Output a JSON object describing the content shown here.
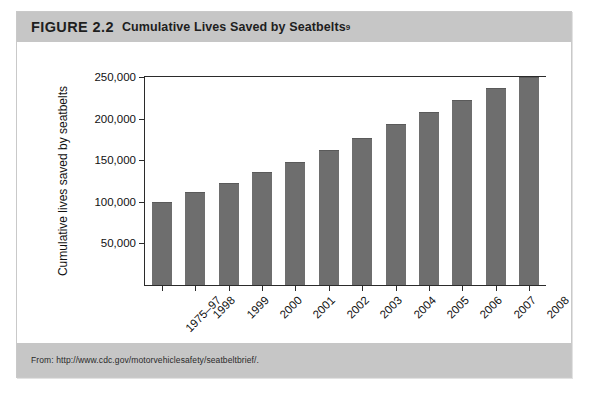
{
  "figure": {
    "label": "FIGURE 2.2",
    "title": "Cumulative Lives Saved by Seatbelts",
    "title_superscript": "9",
    "source": "From: http://www.cdc.gov/motorvehiclesafety/seatbeltbrief/.",
    "header_color": "#c6c6c6",
    "footer_color": "#c6c6c6",
    "bar_color": "#6e6e6e",
    "axis_color": "#2b2b2b",
    "page_background": "#ffffff"
  },
  "chart_data": {
    "type": "bar",
    "title": "Cumulative Lives Saved by Seatbelts",
    "xlabel": "",
    "ylabel": "Cumulative lives saved by seatbelts",
    "categories": [
      "1975–97",
      "1998",
      "1999",
      "2000",
      "2001",
      "2002",
      "2003",
      "2004",
      "2005",
      "2006",
      "2007",
      "2008"
    ],
    "values": [
      100000,
      112000,
      123000,
      136000,
      148000,
      162000,
      177000,
      193000,
      208000,
      222000,
      237000,
      250000
    ],
    "ylim": [
      0,
      250000
    ],
    "ytick_values": [
      50000,
      100000,
      150000,
      200000,
      250000
    ],
    "ytick_labels": [
      "50,000",
      "100,000",
      "150,000",
      "200,000",
      "250,000"
    ],
    "grid": false,
    "legend": false,
    "xtick_label_rotation": -45
  }
}
